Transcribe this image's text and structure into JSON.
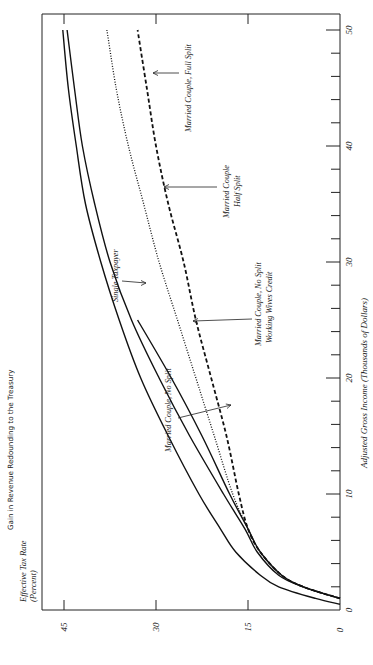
{
  "chart_data": {
    "type": "line",
    "title": "Gain in Revenue Redounding to the Treasury",
    "xlabel": "Adjusted Gross Income  (Thousands of Dollars)",
    "ylabel": "Effective Tax Rate (Percent)",
    "ylabel_line1": "Effective Tax Rate",
    "ylabel_line2": "(Percent)",
    "orientation": "rotated 90° counter-clockwise (income axis vertical on right, tax-rate axis horizontal along bottom)",
    "xlim": [
      0,
      50
    ],
    "ylim": [
      0,
      45
    ],
    "x_ticks": [
      0,
      10,
      20,
      30,
      40,
      50
    ],
    "x_minor_tick_step": 2,
    "y_ticks": [
      0,
      15,
      30,
      45
    ],
    "grid": false,
    "legend": "inline annotations with arrows",
    "series": [
      {
        "name": "Single Taxpayer",
        "style": "solid",
        "x": [
          0.5,
          1,
          2,
          3,
          5,
          7,
          10,
          15,
          20,
          25,
          30,
          35,
          40,
          45,
          50
        ],
        "values": [
          0,
          4,
          10,
          13,
          17,
          19.5,
          23,
          28,
          32.5,
          36,
          39,
          41.5,
          43,
          44.3,
          45.2
        ]
      },
      {
        "name": "Married Couple, No Split",
        "style": "solid",
        "x": [
          1,
          2,
          3,
          5,
          7,
          10,
          15,
          20,
          25,
          30,
          35,
          40,
          45,
          50
        ],
        "values": [
          0,
          6,
          10,
          13.5,
          15.5,
          19,
          24.5,
          29.5,
          34,
          37.5,
          40,
          42,
          43.3,
          44.5
        ]
      },
      {
        "name": "Married Couple, No Split, Working Wives Credit",
        "style": "solid",
        "x": [
          1,
          2,
          3,
          5,
          7,
          10,
          15,
          20,
          25
        ],
        "values": [
          0,
          6,
          9.5,
          13,
          15,
          18,
          22.5,
          27.5,
          33
        ]
      },
      {
        "name": "Married Couple, Half Split",
        "style": "dotted",
        "x": [
          1,
          2,
          3,
          5,
          7,
          10,
          15,
          20,
          25,
          30,
          35,
          40,
          45,
          50
        ],
        "values": [
          0,
          6,
          9.5,
          13,
          15,
          17.5,
          20.5,
          23.5,
          26.5,
          29.5,
          32,
          34.5,
          36.5,
          38
        ]
      },
      {
        "name": "Married Couple, Full Split",
        "style": "dashed",
        "x": [
          1,
          2,
          3,
          5,
          7,
          10,
          15,
          20,
          25,
          30,
          35,
          40,
          45,
          50
        ],
        "values": [
          0,
          6,
          9.5,
          13,
          15,
          16.5,
          18.5,
          21,
          23.5,
          25.5,
          28,
          30,
          31.5,
          33
        ]
      }
    ],
    "annotations": [
      {
        "text": "Single Taxpayer",
        "lines": [
          "Single Taxpayer"
        ]
      },
      {
        "text": "Married Couple, No Split",
        "lines": [
          "Married Couple,  No Split"
        ]
      },
      {
        "text": "Married Couple, No Split Working Wives Credit",
        "lines": [
          "Married Couple, No Split",
          "Working Wives Credit"
        ]
      },
      {
        "text": "Married Couple Half Split",
        "lines": [
          "Married Couple",
          "Half Split"
        ]
      },
      {
        "text": "Married Couple, Full Split",
        "lines": [
          "Married Couple,  Full Split"
        ]
      }
    ]
  }
}
